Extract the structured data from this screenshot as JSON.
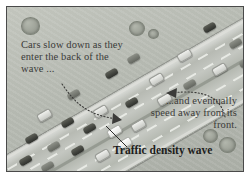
{
  "figure": {
    "frame_color": "#4a4a4a",
    "background_color": "#b9bcb4",
    "road_color": "#bfc2bc"
  },
  "annotations": {
    "left_callout": "Cars slow down as they enter the back of the wave ...",
    "right_callout": "...and eventually speed away from its front.",
    "wave_label": "Traffic density wave"
  },
  "icons": {
    "left_arrow": "dotted-curved-arrow-icon",
    "right_arrow": "dotted-curved-arrow-icon",
    "leader_line": "leader-line-icon"
  },
  "scene": {
    "road": {
      "orientation_deg": -30,
      "lanes": 6,
      "direction_note": "two carriageways separated by median"
    },
    "cars": [
      {
        "x": 196,
        "y": 17,
        "tone": "dk"
      },
      {
        "x": 222,
        "y": 33,
        "tone": "md"
      },
      {
        "x": 170,
        "y": 44,
        "tone": "lt"
      },
      {
        "x": 205,
        "y": 58,
        "tone": "lt"
      },
      {
        "x": 232,
        "y": 52,
        "tone": "md"
      },
      {
        "x": 120,
        "y": 48,
        "tone": "md"
      },
      {
        "x": 98,
        "y": 63,
        "tone": "dk"
      },
      {
        "x": 142,
        "y": 68,
        "tone": "lt"
      },
      {
        "x": 176,
        "y": 74,
        "tone": "md"
      },
      {
        "x": 150,
        "y": 88,
        "tone": "lt"
      },
      {
        "x": 118,
        "y": 92,
        "tone": "dk"
      },
      {
        "x": 60,
        "y": 84,
        "tone": "md"
      },
      {
        "x": 86,
        "y": 100,
        "tone": "lt"
      },
      {
        "x": 30,
        "y": 104,
        "tone": "lt"
      },
      {
        "x": 54,
        "y": 112,
        "tone": "dk"
      },
      {
        "x": 76,
        "y": 118,
        "tone": "dk"
      },
      {
        "x": 100,
        "y": 120,
        "tone": "wh"
      },
      {
        "x": 124,
        "y": 114,
        "tone": "lt"
      },
      {
        "x": 18,
        "y": 128,
        "tone": "dk"
      },
      {
        "x": 40,
        "y": 136,
        "tone": "md"
      },
      {
        "x": 64,
        "y": 140,
        "tone": "dk"
      },
      {
        "x": 88,
        "y": 144,
        "tone": "lt"
      },
      {
        "x": 110,
        "y": 132,
        "tone": "wh"
      },
      {
        "x": 12,
        "y": 150,
        "tone": "dk"
      },
      {
        "x": 34,
        "y": 156,
        "tone": "md"
      }
    ],
    "bushes": [
      {
        "x": 14,
        "y": 10,
        "r": 17
      },
      {
        "x": 122,
        "y": 14,
        "r": 14
      },
      {
        "x": 141,
        "y": 22,
        "r": 9
      },
      {
        "x": 196,
        "y": 122,
        "r": 13
      },
      {
        "x": 212,
        "y": 130,
        "r": 15
      }
    ]
  }
}
